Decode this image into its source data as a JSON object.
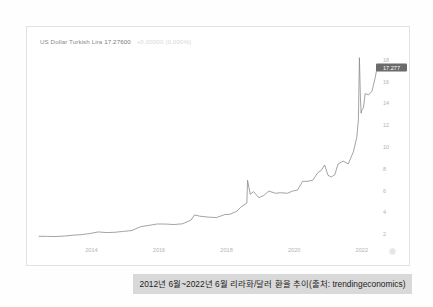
{
  "panel": {
    "title_name": "US Dollar Turkish Lira",
    "title_price": "17.27600",
    "title_change": "+0.00000 (0.000%)",
    "last_price_badge": "17.277",
    "watermark_icon": "logo-watermark-icon"
  },
  "caption": {
    "text": "2012년 6월~2022년 6월 리라화/달러 환율 추이(출처: trendingeconomics)"
  },
  "chart_data": {
    "type": "line",
    "title": "US Dollar Turkish Lira 17.27600",
    "xlabel": "",
    "ylabel": "",
    "xlim": [
      2012.45,
      2022.45
    ],
    "ylim": [
      1.0,
      19.0
    ],
    "grid": false,
    "legend": false,
    "line_color": "#8c8c8c",
    "x_ticks": [
      2014,
      2016,
      2018,
      2020,
      2022
    ],
    "y_ticks": [
      2,
      4,
      6,
      8,
      10,
      12,
      14,
      16,
      18
    ],
    "series": [
      {
        "name": "USD/TRY",
        "x": [
          2012.45,
          2012.7,
          2012.95,
          2013.2,
          2013.45,
          2013.7,
          2013.95,
          2014.2,
          2014.45,
          2014.7,
          2014.95,
          2015.2,
          2015.45,
          2015.7,
          2015.95,
          2016.2,
          2016.45,
          2016.7,
          2016.95,
          2017.05,
          2017.2,
          2017.45,
          2017.7,
          2017.95,
          2018.1,
          2018.3,
          2018.45,
          2018.6,
          2018.62,
          2018.7,
          2018.8,
          2018.95,
          2019.1,
          2019.25,
          2019.45,
          2019.6,
          2019.8,
          2019.95,
          2020.1,
          2020.25,
          2020.4,
          2020.55,
          2020.7,
          2020.8,
          2020.9,
          2021.0,
          2021.1,
          2021.2,
          2021.3,
          2021.45,
          2021.6,
          2021.75,
          2021.85,
          2021.9,
          2021.93,
          2021.96,
          2021.98,
          2022.0,
          2022.05,
          2022.1,
          2022.2,
          2022.3,
          2022.4,
          2022.45
        ],
        "y": [
          1.8,
          1.79,
          1.78,
          1.82,
          1.9,
          1.95,
          2.05,
          2.2,
          2.14,
          2.17,
          2.25,
          2.33,
          2.68,
          2.8,
          2.93,
          2.92,
          2.88,
          2.95,
          3.3,
          3.76,
          3.65,
          3.56,
          3.52,
          3.8,
          3.82,
          4.1,
          4.55,
          4.85,
          6.95,
          5.65,
          5.9,
          5.35,
          5.55,
          5.95,
          5.75,
          5.8,
          5.75,
          5.95,
          6.05,
          6.85,
          6.85,
          6.95,
          7.65,
          7.85,
          8.35,
          7.4,
          7.25,
          7.45,
          8.45,
          8.7,
          8.45,
          9.55,
          10.85,
          12.5,
          18.2,
          14.5,
          13.1,
          13.4,
          13.6,
          14.9,
          14.8,
          15.1,
          16.4,
          17.28
        ]
      }
    ]
  }
}
